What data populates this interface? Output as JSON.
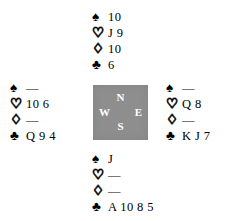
{
  "diagram": {
    "type": "bridge-hand-deal",
    "compass": {
      "north_label": "N",
      "south_label": "S",
      "west_label": "W",
      "east_label": "E",
      "background_color": "#8e8e8e",
      "letter_color": "#ffffff"
    },
    "suit_symbols": {
      "spade": "♠",
      "heart": "♡",
      "diamond": "♢",
      "club": "♣"
    },
    "void_mark": "—",
    "hands": {
      "north": {
        "spades": "10",
        "hearts": "J 9",
        "diamonds": "10",
        "clubs": "6"
      },
      "west": {
        "spades": "—",
        "hearts": "10 6",
        "diamonds": "—",
        "clubs": "Q 9 4"
      },
      "east": {
        "spades": "—",
        "hearts": "Q 8",
        "diamonds": "—",
        "clubs": "K J 7"
      },
      "south": {
        "spades": "J",
        "hearts": "—",
        "diamonds": "—",
        "clubs": "A 10 8 5"
      }
    }
  }
}
